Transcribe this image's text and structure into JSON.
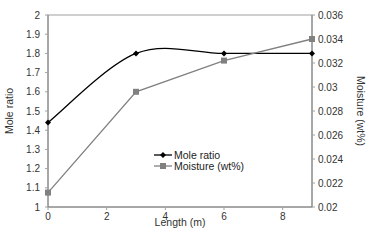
{
  "chart_data": {
    "type": "line",
    "title": "",
    "xlabel": "Length (m)",
    "ylabel": "Mole ratio",
    "y2label": "Moisture (wt%)",
    "xlim": [
      0,
      9
    ],
    "ylim": [
      1,
      2
    ],
    "y2lim": [
      0.02,
      0.036
    ],
    "x_ticks": [
      "0",
      "2",
      "4",
      "6",
      "8"
    ],
    "y_ticks": [
      "1",
      "1.1",
      "1.2",
      "1.3",
      "1.4",
      "1.5",
      "1.6",
      "1.7",
      "1.8",
      "1.9",
      "2"
    ],
    "y2_ticks": [
      "0.02",
      "0.022",
      "0.024",
      "0.026",
      "0.028",
      "0.03",
      "0.032",
      "0.034",
      "0.036"
    ],
    "grid": false,
    "legend_position": "inside-center",
    "series": [
      {
        "name": "Mole ratio",
        "axis": "left",
        "marker": "diamond",
        "color": "#000000",
        "smooth": true,
        "x": [
          0,
          3,
          6,
          9
        ],
        "values": [
          1.44,
          1.8,
          1.8,
          1.8
        ]
      },
      {
        "name": "Moisture (wt%)",
        "axis": "right",
        "marker": "square",
        "color": "#808080",
        "smooth": false,
        "x": [
          0,
          3,
          6,
          9
        ],
        "values": [
          0.0212,
          0.0296,
          0.0322,
          0.034
        ]
      }
    ]
  }
}
